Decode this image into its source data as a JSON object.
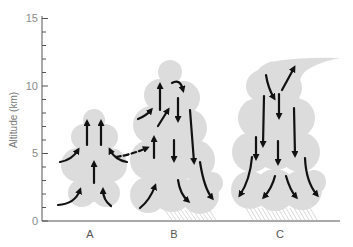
{
  "figure": {
    "type": "thunderstorm-life-cycle",
    "y_axis": {
      "title": "Altitude (km)",
      "ticks": [
        "0",
        "5",
        "10",
        "15"
      ],
      "min": 0,
      "max": 15,
      "minor_tick_step": 1
    },
    "stages": [
      {
        "label": "A",
        "name": "cumulus-stage",
        "top_km": 8.5,
        "air_motion": "updrafts"
      },
      {
        "label": "B",
        "name": "mature-stage",
        "top_km": 11.5,
        "air_motion": "updrafts and downdrafts",
        "precipitation": true
      },
      {
        "label": "C",
        "name": "dissipating-stage",
        "top_km": 12,
        "air_motion": "downdrafts",
        "precipitation": true,
        "anvil": true
      }
    ],
    "colors": {
      "cloud": "#dcdcdc",
      "arrow": "#111111",
      "axis": "#555555",
      "rain": "#cfcfcf"
    }
  }
}
